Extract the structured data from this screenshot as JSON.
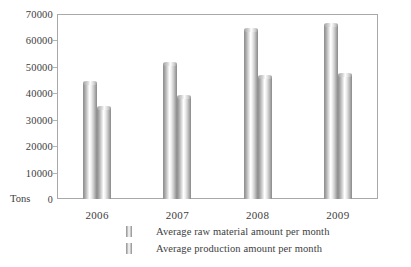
{
  "chart_data": {
    "type": "bar",
    "title": "",
    "subtitle": "",
    "xlabel": "",
    "ylabel": "Tons",
    "categories": [
      "2006",
      "2007",
      "2008",
      "2009"
    ],
    "series": [
      {
        "name": "Average raw material amount per month",
        "values": [
          44000,
          51000,
          64000,
          66000
        ]
      },
      {
        "name": "Average production amount per month",
        "values": [
          34500,
          38500,
          46000,
          47000
        ]
      }
    ],
    "ylim": [
      0,
      70000
    ],
    "ytick_step": 10000,
    "ytick_labels": [
      "70000",
      "60000",
      "50000",
      "40000",
      "30000",
      "20000",
      "10000",
      "0"
    ],
    "ytick_values": [
      70000,
      60000,
      50000,
      40000,
      30000,
      20000,
      10000,
      0
    ],
    "grid": false,
    "legend_position": "bottom-left",
    "bar_style": "cylinder",
    "colors": {
      "bar_light": "#ffffff",
      "bar_dark": "#8f8f8f",
      "axis": "#a9a9a9",
      "text": "#3d3d3d",
      "background": "#ffffff"
    }
  },
  "axis": {
    "unit_label": "Tons"
  },
  "legend": {
    "items": [
      {
        "label": "Average raw material amount per month"
      },
      {
        "label": "Average production amount per month"
      }
    ]
  }
}
